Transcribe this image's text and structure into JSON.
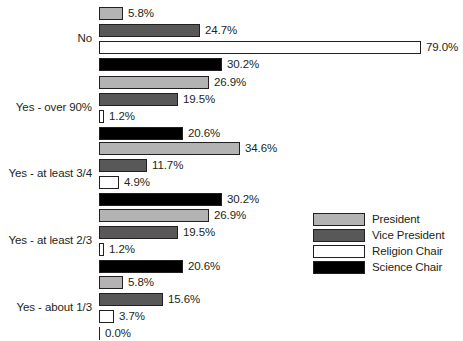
{
  "chart_data": {
    "type": "bar",
    "orientation": "horizontal",
    "title": "",
    "subtitle": "",
    "xlabel": "",
    "ylabel": "",
    "xlim": [
      0,
      79.0
    ],
    "grid": false,
    "legend_position": "middle-right",
    "value_suffix": "%",
    "categories": [
      "No",
      "Yes - over 90%",
      "Yes - at least 3/4",
      "Yes - at least 2/3",
      "Yes - about 1/3"
    ],
    "series": [
      {
        "name": "President",
        "color": "#b3b3b3",
        "values": [
          5.8,
          26.9,
          34.6,
          26.9,
          5.8
        ]
      },
      {
        "name": "Vice President",
        "color": "#585858",
        "values": [
          24.7,
          19.5,
          11.7,
          19.5,
          15.6
        ]
      },
      {
        "name": "Religion Chair",
        "color": "#ffffff",
        "values": [
          79.0,
          1.2,
          4.9,
          1.2,
          3.7
        ]
      },
      {
        "name": "Science Chair",
        "color": "#000000",
        "values": [
          30.2,
          20.6,
          30.2,
          20.6,
          0.0
        ]
      }
    ],
    "labels": [
      [
        "5.8%",
        "24.7%",
        "79.0%",
        "30.2%"
      ],
      [
        "26.9%",
        "19.5%",
        "1.2%",
        "20.6%"
      ],
      [
        "34.6%",
        "11.7%",
        "4.9%",
        "30.2%"
      ],
      [
        "26.9%",
        "19.5%",
        "1.2%",
        "20.6%"
      ],
      [
        "5.8%",
        "15.6%",
        "3.7%",
        "0.0%"
      ]
    ]
  },
  "legend": {
    "items": [
      {
        "label": "President",
        "series_key": "president"
      },
      {
        "label": "Vice President",
        "series_key": "vicepres"
      },
      {
        "label": "Religion Chair",
        "series_key": "religion"
      },
      {
        "label": "Science Chair",
        "series_key": "science"
      }
    ]
  }
}
